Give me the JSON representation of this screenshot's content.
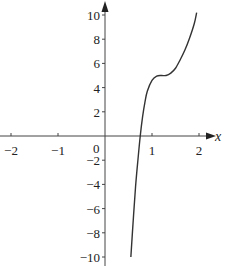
{
  "chart_data": {
    "type": "line",
    "title": "",
    "xlabel": "x",
    "ylabel": "y",
    "xlim": [
      -2.2,
      2.3
    ],
    "ylim": [
      -10.8,
      10.8
    ],
    "grid": false,
    "legend": null,
    "x_ticks": [
      -2,
      -1,
      0,
      1,
      2
    ],
    "x_tick_labels": [
      "−2",
      "−1",
      "0",
      "1",
      "2"
    ],
    "y_ticks": [
      -10,
      -8,
      -6,
      -4,
      -2,
      2,
      4,
      6,
      8,
      10
    ],
    "y_tick_labels": [
      "−10",
      "−8",
      "−6",
      "−4",
      "−2",
      "2",
      "4",
      "6",
      "8",
      "10"
    ],
    "origin_label": "0",
    "series": [
      {
        "name": "f(x)",
        "x": [
          0.55,
          0.6,
          0.65,
          0.7,
          0.75,
          0.8,
          0.85,
          0.9,
          1.0,
          1.1,
          1.2,
          1.3,
          1.4,
          1.5,
          1.6,
          1.7,
          1.8,
          1.9,
          1.95
        ],
        "values": [
          -10,
          -7.0,
          -4.2,
          -2.0,
          0,
          1.6,
          2.8,
          3.7,
          4.6,
          4.95,
          5.0,
          5.0,
          5.2,
          5.6,
          6.3,
          7.1,
          8.1,
          9.3,
          10.2
        ]
      }
    ],
    "colors": {
      "curve": "#333333",
      "axis": "#444444"
    }
  }
}
